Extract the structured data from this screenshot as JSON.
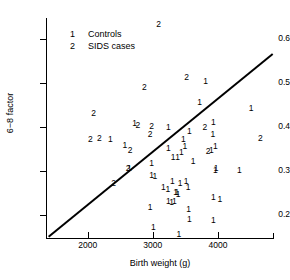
{
  "chart_data": {
    "type": "scatter",
    "title": "",
    "xlabel": "Birth weight (g)",
    "ylabel": "6−8 factor",
    "xlim": [
      1360,
      4860
    ],
    "ylim": [
      0.147,
      0.647
    ],
    "xticks": [
      2000,
      3000,
      4000
    ],
    "xtick_labels": [
      "2000",
      "3000",
      "4000"
    ],
    "yticks": [
      0.2,
      0.3,
      0.4,
      0.5,
      0.6
    ],
    "ytick_labels": [
      "0.2",
      "0.3",
      "0.4",
      "0.5",
      "0.6"
    ],
    "grid": false,
    "legend_position": "upper left",
    "legend": [
      {
        "symbol": "1",
        "label": "Controls"
      },
      {
        "symbol": "2",
        "label": "SIDS cases"
      }
    ],
    "annotations": [
      {
        "name": "identity-reference-line",
        "type": "line",
        "x0": 1400,
        "y0": 0.15,
        "x1": 4840,
        "y1": 0.565
      }
    ],
    "series": [
      {
        "name": "SIDS cases",
        "symbol": "2",
        "points": [
          [
            3090,
            0.633
          ],
          [
            3520,
            0.513
          ],
          [
            2870,
            0.49
          ],
          [
            2090,
            0.43
          ],
          [
            2040,
            0.372
          ],
          [
            2180,
            0.375
          ],
          [
            2770,
            0.403
          ],
          [
            2980,
            0.402
          ],
          [
            2960,
            0.384
          ],
          [
            3800,
            0.4
          ],
          [
            3850,
            0.345
          ],
          [
            4650,
            0.375
          ],
          [
            2650,
            0.347
          ],
          [
            2620,
            0.305
          ],
          [
            2400,
            0.272
          ]
        ]
      },
      {
        "name": "Controls",
        "symbol": "1",
        "points": [
          [
            3810,
            0.503
          ],
          [
            3720,
            0.455
          ],
          [
            4510,
            0.442
          ],
          [
            2720,
            0.408
          ],
          [
            3240,
            0.4
          ],
          [
            3930,
            0.41
          ],
          [
            3920,
            0.383
          ],
          [
            3560,
            0.39
          ],
          [
            2350,
            0.372
          ],
          [
            2570,
            0.358
          ],
          [
            3470,
            0.372
          ],
          [
            3490,
            0.357
          ],
          [
            3960,
            0.355
          ],
          [
            3900,
            0.348
          ],
          [
            3240,
            0.352
          ],
          [
            3440,
            0.343
          ],
          [
            3310,
            0.332
          ],
          [
            3380,
            0.33
          ],
          [
            3620,
            0.323
          ],
          [
            2640,
            0.307
          ],
          [
            2980,
            0.317
          ],
          [
            3970,
            0.305
          ],
          [
            3960,
            0.302
          ],
          [
            4330,
            0.302
          ],
          [
            2980,
            0.29
          ],
          [
            3030,
            0.288
          ],
          [
            3300,
            0.277
          ],
          [
            3420,
            0.272
          ],
          [
            3510,
            0.277
          ],
          [
            3540,
            0.263
          ],
          [
            3160,
            0.262
          ],
          [
            3230,
            0.258
          ],
          [
            3350,
            0.252
          ],
          [
            3370,
            0.252
          ],
          [
            3390,
            0.248
          ],
          [
            3930,
            0.24
          ],
          [
            4030,
            0.235
          ],
          [
            3240,
            0.232
          ],
          [
            3290,
            0.228
          ],
          [
            3330,
            0.23
          ],
          [
            2960,
            0.218
          ],
          [
            3550,
            0.212
          ],
          [
            3560,
            0.19
          ],
          [
            3930,
            0.188
          ],
          [
            3010,
            0.172
          ],
          [
            3400,
            0.157
          ]
        ]
      }
    ]
  }
}
